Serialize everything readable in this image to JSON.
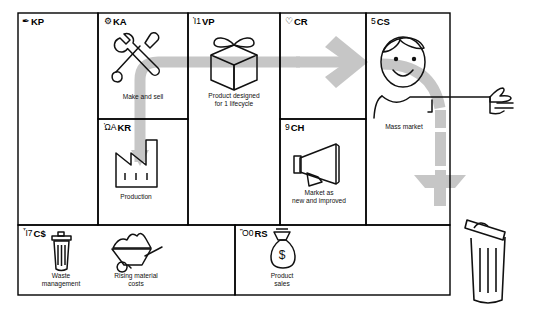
{
  "diagram": {
    "type": "business-model-canvas",
    "stroke_color": "#000000",
    "arrow_color": "#c6c6c6",
    "background": "#ffffff"
  },
  "blocks": {
    "kp": {
      "code": "KP",
      "name": "Key Partners",
      "icon": "pen-icon",
      "glyph": "✒",
      "items": []
    },
    "ka": {
      "code": "KA",
      "name": "Key Activities",
      "icon": "gear-icon",
      "glyph": "⚙",
      "caption": "Make and sell",
      "item_icon": "wrench-screwdriver-icon"
    },
    "kr": {
      "code": "KR",
      "name": "Key Resources",
      "icon": "truck-icon",
      "glyph": "ὩA",
      "caption": "Production",
      "item_icon": "factory-icon"
    },
    "vp": {
      "code": "VP",
      "name": "Value Propositions",
      "icon": "gift-icon",
      "glyph": "Ἰ1",
      "caption": "Product designed\nfor 1 lifecycle",
      "item_icon": "gift-box-icon"
    },
    "cr": {
      "code": "CR",
      "name": "Customer Relationships",
      "icon": "heart-icon",
      "glyph": "♡",
      "items": []
    },
    "ch": {
      "code": "CH",
      "name": "Channels",
      "icon": "speech-bubble-icon",
      "glyph": "὞9",
      "caption": "Market as\nnew and improved",
      "item_icon": "megaphone-icon"
    },
    "cs": {
      "code": "CS",
      "name": "Customer Segments",
      "icon": "people-icon",
      "glyph": "὆5",
      "caption": "Mass market",
      "item_icon": "person-face-icon"
    },
    "cost": {
      "code": "C$",
      "name": "Cost Structure",
      "icon": "tag-icon",
      "glyph": "Ἷ7",
      "items": [
        {
          "caption": "Waste\nmanagement",
          "item_icon": "trash-can-icon"
        },
        {
          "caption": "Rising material\ncosts",
          "item_icon": "wheelbarrow-icon"
        }
      ]
    },
    "rs": {
      "code": "RS",
      "name": "Revenue Streams",
      "icon": "money-icon",
      "glyph": "Ὃ0",
      "items": [
        {
          "caption": "Product\nsales",
          "item_icon": "money-bag-icon"
        }
      ]
    }
  },
  "flow": {
    "name": "linear-flow-arrow",
    "description": "Gray flow from Key Resources up through Key Activities, across Value Propositions and Customer Relationships to Customer Segments, then curving down to disposal",
    "end_icon": "trash-can-icon"
  }
}
